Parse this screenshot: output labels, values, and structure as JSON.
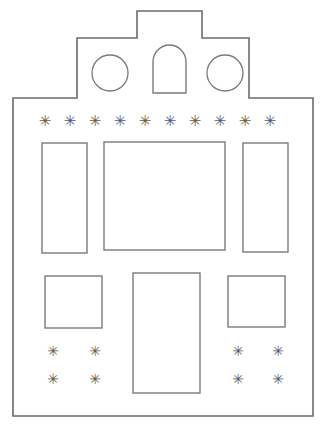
{
  "drawing": {
    "title": "Stepped Gable House Facade Template",
    "subject": "house-facade-line-drawing",
    "style": "outline-only-line-art",
    "background_color": "#ffffff",
    "outline_color": "#6b6b6b",
    "detail_color": "#7a7a7a",
    "decoration_color": "#5a5a5a",
    "canvas": {
      "width": 326,
      "height": 432
    }
  },
  "outline": {
    "name": "stepped-gable-facade-outline",
    "description": "Closed polygon forming a house front with a three-step crow-stepped gable top and a wide rectangular body",
    "steps": 3,
    "points": "13,416 13,98 77,98 77,38 137,38 137,11 202,11 202,38 249,38 249,98 313,98 313,416"
  },
  "gable": {
    "name": "gable-top-section",
    "peak_label": "center peak",
    "circles": [
      {
        "id": "left-round-window",
        "cx": 110,
        "cy": 73,
        "r": 18
      },
      {
        "id": "right-round-window",
        "cx": 225,
        "cy": 73,
        "r": 18
      }
    ],
    "arch": {
      "id": "center-arch-window",
      "x": 153,
      "y": 45,
      "width": 33,
      "height": 48,
      "arch_radius": 16
    }
  },
  "decor_rows": {
    "top_row": {
      "name": "top-star-row",
      "glyph": "✳",
      "count": 10,
      "y": 121,
      "x_start": 45,
      "x_step": 25
    },
    "bottom_left_cluster": {
      "name": "bottom-left-star-cluster",
      "glyph": "✳",
      "count": 4,
      "columns": [
        53,
        95
      ],
      "rows": [
        351,
        379
      ]
    },
    "bottom_right_cluster": {
      "name": "bottom-right-star-cluster",
      "glyph": "✳",
      "count": 4,
      "columns": [
        238,
        278
      ],
      "rows": [
        351,
        379
      ]
    }
  },
  "upper_windows": [
    {
      "id": "upper-left-window",
      "label": "tall left window",
      "x": 42,
      "y": 143,
      "width": 45,
      "height": 110
    },
    {
      "id": "upper-center-window",
      "label": "large center window",
      "x": 104,
      "y": 142,
      "width": 121,
      "height": 108
    },
    {
      "id": "upper-right-window",
      "label": "tall right window",
      "x": 243,
      "y": 143,
      "width": 45,
      "height": 109
    }
  ],
  "lower_openings": [
    {
      "id": "lower-left-window",
      "label": "square left window",
      "x": 45,
      "y": 276,
      "width": 57,
      "height": 52
    },
    {
      "id": "front-door",
      "label": "center front door",
      "x": 133,
      "y": 273,
      "width": 67,
      "height": 120
    },
    {
      "id": "lower-right-window",
      "label": "square right window",
      "x": 228,
      "y": 276,
      "width": 57,
      "height": 51
    }
  ]
}
